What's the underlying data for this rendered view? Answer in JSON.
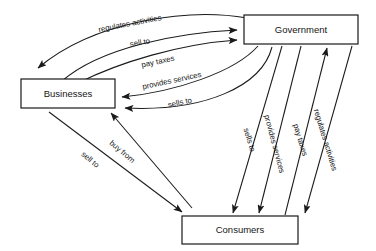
{
  "diagram": {
    "background_color": "#ffffff",
    "line_color": "#1a1a1a",
    "text_color": "#151515",
    "nodes": [
      {
        "id": "government",
        "label": "Government",
        "x": 244,
        "y": 15,
        "w": 114,
        "h": 29
      },
      {
        "id": "businesses",
        "label": "Businesses",
        "x": 21,
        "y": 79,
        "w": 94,
        "h": 29
      },
      {
        "id": "consumers",
        "label": "Consumers",
        "x": 182,
        "y": 216,
        "w": 116,
        "h": 28
      }
    ],
    "edges": [
      {
        "id": "gov-regulates-businesses",
        "label": "regulates activities",
        "from": "government",
        "to": "businesses",
        "label_x": 130,
        "label_y": 24,
        "label_rotate": -11
      },
      {
        "id": "businesses-sell-to-gov",
        "label": "sell to",
        "from": "businesses",
        "to": "government",
        "label_x": 140,
        "label_y": 43,
        "label_rotate": -10
      },
      {
        "id": "businesses-pay-taxes-gov",
        "label": "pay taxes",
        "from": "businesses",
        "to": "government",
        "label_x": 158,
        "label_y": 62,
        "label_rotate": -12
      },
      {
        "id": "gov-provides-services-businesses",
        "label": "provides services",
        "from": "government",
        "to": "businesses",
        "label_x": 172,
        "label_y": 81,
        "label_rotate": -12
      },
      {
        "id": "gov-sells-to-businesses",
        "label": "sells to",
        "from": "government",
        "to": "businesses",
        "label_x": 180,
        "label_y": 103,
        "label_rotate": -12
      },
      {
        "id": "gov-sells-to-consumers",
        "label": "sells to",
        "from": "government",
        "to": "consumers",
        "label_x": 249,
        "label_y": 140,
        "label_rotate": 73
      },
      {
        "id": "gov-provides-services-consumers",
        "label": "provides services",
        "from": "government",
        "to": "consumers",
        "label_x": 274,
        "label_y": 144,
        "label_rotate": 75
      },
      {
        "id": "consumers-pay-taxes-gov",
        "label": "pay taxes",
        "from": "consumers",
        "to": "government",
        "label_x": 300,
        "label_y": 140,
        "label_rotate": 73
      },
      {
        "id": "gov-regulates-consumers",
        "label": "regulates activities",
        "from": "government",
        "to": "consumers",
        "label_x": 325,
        "label_y": 140,
        "label_rotate": 73
      },
      {
        "id": "consumers-buy-from-businesses",
        "label": "buy from",
        "from": "consumers",
        "to": "businesses",
        "label_x": 122,
        "label_y": 152,
        "label_rotate": 40
      },
      {
        "id": "businesses-sell-to-consumers",
        "label": "sell to",
        "from": "businesses",
        "to": "consumers",
        "label_x": 90,
        "label_y": 160,
        "label_rotate": 40
      }
    ]
  }
}
